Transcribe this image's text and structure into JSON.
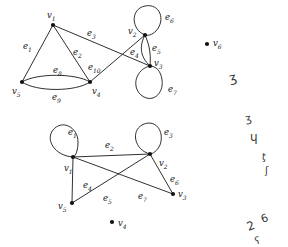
{
  "figure": {
    "stroke_color": "#1a1a1a",
    "vertex_color": "#111111",
    "background_color": "#ffffff"
  },
  "graphs": [
    {
      "id": "top-graph",
      "name": "top-multigraph",
      "vertices": [
        {
          "id": "v1",
          "label": "v",
          "sub": "1",
          "x": 53,
          "y": 25,
          "label_x": 47,
          "label_y": 11
        },
        {
          "id": "v2",
          "label": "v",
          "sub": "2",
          "x": 145,
          "y": 35,
          "label_x": 128,
          "label_y": 27
        },
        {
          "id": "v3",
          "label": "v",
          "sub": "3",
          "x": 150,
          "y": 66,
          "label_x": 154,
          "label_y": 59
        },
        {
          "id": "v4",
          "label": "v",
          "sub": "4",
          "x": 90,
          "y": 82,
          "label_x": 92,
          "label_y": 87
        },
        {
          "id": "v5",
          "label": "v",
          "sub": "5",
          "x": 22,
          "y": 82,
          "label_x": 12,
          "label_y": 87
        },
        {
          "id": "v6",
          "label": "v",
          "sub": "6",
          "x": 207,
          "y": 44,
          "label_x": 213,
          "label_y": 39
        }
      ],
      "edges": [
        {
          "id": "e1",
          "label": "e",
          "sub": "1",
          "from": "v1",
          "to": "v5",
          "kind": "line",
          "label_x": 23,
          "label_y": 42
        },
        {
          "id": "e2",
          "label": "e",
          "sub": "2",
          "from": "v1",
          "to": "v4",
          "kind": "line",
          "label_x": 73,
          "label_y": 48
        },
        {
          "id": "e3",
          "label": "e",
          "sub": "3",
          "from": "v1",
          "to": "v3",
          "kind": "line",
          "label_x": 87,
          "label_y": 29
        },
        {
          "id": "e4",
          "label": "e",
          "sub": "4",
          "from": "v2",
          "to": "v3",
          "kind": "curve-left",
          "label_x": 130,
          "label_y": 48
        },
        {
          "id": "e5",
          "label": "e",
          "sub": "5",
          "from": "v2",
          "to": "v3",
          "kind": "curve-right",
          "label_x": 152,
          "label_y": 44
        },
        {
          "id": "e6",
          "label": "e",
          "sub": "6",
          "from": "v2",
          "to": "v2",
          "kind": "loop-up",
          "label_x": 165,
          "label_y": 13
        },
        {
          "id": "e7",
          "label": "e",
          "sub": "7",
          "from": "v3",
          "to": "v3",
          "kind": "loop-down",
          "label_x": 168,
          "label_y": 85
        },
        {
          "id": "e8",
          "label": "e",
          "sub": "8",
          "from": "v5",
          "to": "v4",
          "kind": "curve-up",
          "label_x": 53,
          "label_y": 66
        },
        {
          "id": "e9",
          "label": "e",
          "sub": "9",
          "from": "v5",
          "to": "v4",
          "kind": "curve-down",
          "label_x": 52,
          "label_y": 93
        },
        {
          "id": "e10",
          "label": "e",
          "sub": "10",
          "from": "v4",
          "to": "v2",
          "kind": "line",
          "label_x": 88,
          "label_y": 63
        }
      ]
    },
    {
      "id": "bottom-graph",
      "name": "bottom-multigraph",
      "vertices": [
        {
          "id": "v1",
          "label": "v",
          "sub": "1",
          "x": 73,
          "y": 157,
          "label_x": 64,
          "label_y": 164
        },
        {
          "id": "v2",
          "label": "v",
          "sub": "2",
          "x": 150,
          "y": 154,
          "label_x": 159,
          "label_y": 159
        },
        {
          "id": "v3",
          "label": "v",
          "sub": "3",
          "x": 173,
          "y": 194,
          "label_x": 178,
          "label_y": 190
        },
        {
          "id": "v4",
          "label": "v",
          "sub": "4",
          "x": 112,
          "y": 222,
          "label_x": 118,
          "label_y": 219
        },
        {
          "id": "v5",
          "label": "v",
          "sub": "5",
          "x": 72,
          "y": 203,
          "label_x": 58,
          "label_y": 202
        }
      ],
      "edges": [
        {
          "id": "e1",
          "label": "e",
          "sub": "1",
          "from": "v1",
          "to": "v1",
          "kind": "loop-upleft",
          "label_x": 68,
          "label_y": 128
        },
        {
          "id": "e2",
          "label": "e",
          "sub": "2",
          "from": "v1",
          "to": "v2",
          "kind": "line",
          "label_x": 105,
          "label_y": 141
        },
        {
          "id": "e3",
          "label": "e",
          "sub": "3",
          "from": "v2",
          "to": "v2",
          "kind": "loop-upright",
          "label_x": 164,
          "label_y": 128
        },
        {
          "id": "e4",
          "label": "e",
          "sub": "4",
          "from": "v5",
          "to": "v1",
          "kind": "line",
          "label_x": 83,
          "label_y": 181
        },
        {
          "id": "e5",
          "label": "e",
          "sub": "5",
          "from": "v5",
          "to": "v2",
          "kind": "line",
          "label_x": 103,
          "label_y": 194
        },
        {
          "id": "e6",
          "label": "e",
          "sub": "6",
          "from": "v2",
          "to": "v3",
          "kind": "line",
          "label_x": 170,
          "label_y": 175
        },
        {
          "id": "e7",
          "label": "e",
          "sub": "7",
          "from": "v1",
          "to": "v3",
          "kind": "line",
          "label_x": 138,
          "label_y": 192
        }
      ]
    }
  ],
  "margin_scribbles": [
    {
      "id": "mark-1",
      "text": "ʒ",
      "x": 229,
      "y": 71,
      "size": 13,
      "rotate": -12
    },
    {
      "id": "mark-2",
      "text": "ʒ",
      "x": 245,
      "y": 113,
      "size": 11,
      "rotate": -10
    },
    {
      "id": "mark-3",
      "text": "ɥ",
      "x": 250,
      "y": 131,
      "size": 12,
      "rotate": 0
    },
    {
      "id": "mark-4",
      "text": "ƫ",
      "x": 262,
      "y": 152,
      "size": 10,
      "rotate": 8
    },
    {
      "id": "mark-5",
      "text": "ʃ",
      "x": 265,
      "y": 166,
      "size": 10,
      "rotate": 0
    },
    {
      "id": "mark-6",
      "text": "2",
      "x": 247,
      "y": 220,
      "size": 12,
      "rotate": -20
    },
    {
      "id": "mark-7",
      "text": "6",
      "x": 261,
      "y": 213,
      "size": 11,
      "rotate": -20
    },
    {
      "id": "mark-8",
      "text": "ʕ",
      "x": 255,
      "y": 236,
      "size": 10,
      "rotate": -15
    }
  ]
}
